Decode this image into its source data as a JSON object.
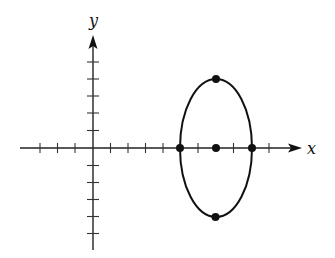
{
  "diagram": {
    "type": "ellipse-on-axes",
    "axes": {
      "x_label": "x",
      "y_label": "y",
      "x_ticks": [
        -3,
        -2,
        -1,
        1,
        2,
        3,
        4,
        5,
        6,
        7,
        8,
        9,
        10
      ],
      "y_ticks": [
        -5,
        -4,
        -3,
        -2,
        -1,
        1,
        2,
        3,
        4,
        5
      ]
    },
    "ellipse": {
      "center": [
        7,
        0
      ],
      "semi_axis_x": 2,
      "semi_axis_y": 4,
      "marked_points": [
        [
          7,
          0
        ],
        [
          5,
          0
        ],
        [
          9,
          0
        ],
        [
          7,
          4
        ],
        [
          7,
          -4
        ]
      ]
    }
  }
}
